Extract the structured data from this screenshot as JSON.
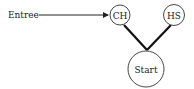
{
  "diagram": {
    "entry_label": "Entree",
    "nodes": [
      {
        "id": "CH",
        "label": "CH"
      },
      {
        "id": "HS",
        "label": "HS"
      },
      {
        "id": "start",
        "label": "Start"
      }
    ],
    "edges": [
      {
        "from": "Entree",
        "to": "CH",
        "style": "arrow"
      },
      {
        "from": "CH",
        "to": "start",
        "style": "thick-line"
      },
      {
        "from": "HS",
        "to": "start",
        "style": "thick-line"
      }
    ]
  }
}
